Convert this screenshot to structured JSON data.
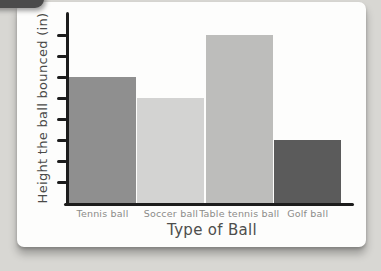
{
  "scene": {
    "description_labels": {
      "ylabel": "Height the ball bounced (in)",
      "xlabel": "Type of Ball"
    }
  },
  "chart_data": {
    "type": "bar",
    "categories": [
      "Tennis ball",
      "Soccer ball",
      "Table tennis ball",
      "Golf ball"
    ],
    "values": [
      6,
      5,
      8,
      3
    ],
    "bar_colors": [
      "#8f8f8f",
      "#d3d3d2",
      "#bdbdbb",
      "#5b5b5b"
    ],
    "title": "",
    "xlabel": "Type of Ball",
    "ylabel": "Height the ball bounced (in)",
    "ylim": [
      0,
      8
    ],
    "y_tick_interval": 1,
    "y_tick_labels_visible": false,
    "grid": false,
    "legend": null,
    "axis_color": "#1c1c1c",
    "category_label_color": "#8b8b89",
    "card_background": "#fdfdfc",
    "page_background": "#d8d7d3"
  }
}
